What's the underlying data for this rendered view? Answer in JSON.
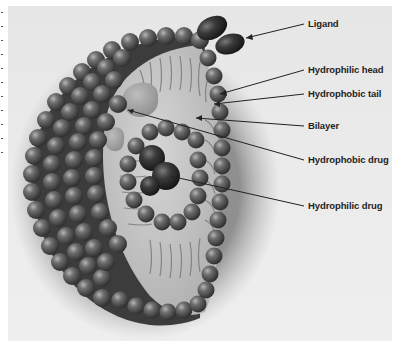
{
  "diagram": {
    "labels": [
      {
        "id": "ligand",
        "text": "Ligand",
        "x": 308,
        "y": 18
      },
      {
        "id": "hydrophilic-head",
        "text": "Hydrophilic head",
        "x": 308,
        "y": 64
      },
      {
        "id": "hydrophobic-tail",
        "text": "Hydrophobic tail",
        "x": 308,
        "y": 88
      },
      {
        "id": "bilayer",
        "text": "Bilayer",
        "x": 308,
        "y": 120
      },
      {
        "id": "hydrophobic-drug",
        "text": "Hydrophobic drug",
        "x": 308,
        "y": 154
      },
      {
        "id": "hydrophilic-drug",
        "text": "Hydrophilic drug",
        "x": 308,
        "y": 200
      }
    ],
    "colors": {
      "background": "#e8e8e8",
      "sphere": "#5a5a5a",
      "sphere_highlight": "#a8a8a8",
      "interior": "#c8c8c8",
      "label_text": "#1e1e1e",
      "leader_line": "#222222"
    }
  }
}
